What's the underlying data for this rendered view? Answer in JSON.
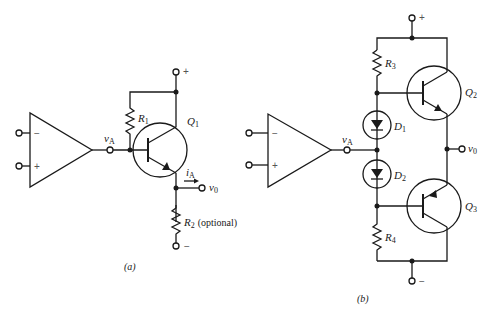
{
  "figure": {
    "circuit_a": {
      "caption": "(a)",
      "opamp_inputs": {
        "inverting": "−",
        "noninverting": "+"
      },
      "node_vA": {
        "label": "v",
        "sub": "A"
      },
      "resistor_1": {
        "label": "R",
        "sub": "1"
      },
      "transistor": {
        "label": "Q",
        "sub": "1",
        "type": "NPN"
      },
      "current": {
        "label": "i",
        "sub": "A"
      },
      "output": {
        "label": "v",
        "sub": "0"
      },
      "resistor_2": {
        "label": "R",
        "sub": "2",
        "note": "(optional)"
      },
      "supply_pos": "+",
      "supply_neg": "−"
    },
    "circuit_b": {
      "caption": "(b)",
      "opamp_inputs": {
        "inverting": "−",
        "noninverting": "+"
      },
      "node_vA": {
        "label": "v",
        "sub": "A"
      },
      "resistor_3": {
        "label": "R",
        "sub": "3"
      },
      "resistor_4": {
        "label": "R",
        "sub": "4"
      },
      "diode_1": {
        "label": "D",
        "sub": "1"
      },
      "diode_2": {
        "label": "D",
        "sub": "2"
      },
      "transistor_top": {
        "label": "Q",
        "sub": "2",
        "type": "NPN"
      },
      "transistor_bottom": {
        "label": "Q",
        "sub": "3",
        "type": "PNP"
      },
      "output": {
        "label": "v",
        "sub": "0"
      },
      "supply_pos": "+",
      "supply_neg": "−"
    }
  }
}
